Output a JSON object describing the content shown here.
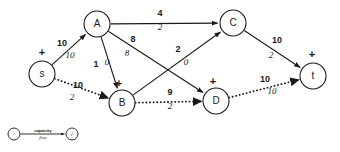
{
  "diagram": {
    "type": "network-flow-graph",
    "width": 340,
    "height": 152,
    "background_color": "#ffffff",
    "stroke_color": "#1a1a1a",
    "nodes": [
      {
        "id": "s",
        "label": "s",
        "x": 42,
        "y": 74,
        "r": 13,
        "marker": "+",
        "marker_x": 42,
        "marker_y": 53
      },
      {
        "id": "A",
        "label": "A",
        "x": 97,
        "y": 24,
        "r": 13,
        "marker": "",
        "marker_x": 0,
        "marker_y": 0
      },
      {
        "id": "B",
        "label": "B",
        "x": 122,
        "y": 103,
        "r": 13,
        "marker": "+",
        "marker_x": 119,
        "marker_y": 84
      },
      {
        "id": "C",
        "label": "C",
        "x": 233,
        "y": 23,
        "r": 13,
        "marker": "",
        "marker_x": 0,
        "marker_y": 0
      },
      {
        "id": "D",
        "label": "D",
        "x": 216,
        "y": 101,
        "r": 13,
        "marker": "+",
        "marker_x": 213,
        "marker_y": 82
      },
      {
        "id": "t",
        "label": "t",
        "x": 313,
        "y": 76,
        "r": 13,
        "marker": "+",
        "marker_x": 312,
        "marker_y": 55
      }
    ],
    "edges": [
      {
        "id": "s-A",
        "from": "s",
        "to": "A",
        "capacity": "10",
        "flow": "10",
        "style": "solid",
        "cap_x": 62,
        "cap_y": 44,
        "flow_x": 70,
        "flow_y": 56
      },
      {
        "id": "s-B",
        "from": "s",
        "to": "B",
        "capacity": "10",
        "flow": "2",
        "style": "dashed",
        "cap_x": 78,
        "cap_y": 86,
        "flow_x": 72,
        "flow_y": 98
      },
      {
        "id": "A-C",
        "from": "A",
        "to": "C",
        "capacity": "4",
        "flow": "2",
        "style": "solid",
        "cap_x": 160,
        "cap_y": 14,
        "flow_x": 160,
        "flow_y": 28
      },
      {
        "id": "A-B",
        "from": "A",
        "to": "B",
        "capacity": "1",
        "flow": "0",
        "style": "solid",
        "cap_x": 96,
        "cap_y": 65,
        "flow_x": 107,
        "flow_y": 63
      },
      {
        "id": "A-D",
        "from": "A",
        "to": "D",
        "capacity": "8",
        "flow": "8",
        "style": "solid",
        "cap_x": 133,
        "cap_y": 40,
        "flow_x": 127,
        "flow_y": 54
      },
      {
        "id": "B-C",
        "from": "B",
        "to": "C",
        "capacity": "2",
        "flow": "0",
        "style": "solid",
        "cap_x": 178,
        "cap_y": 50,
        "flow_x": 186,
        "flow_y": 63
      },
      {
        "id": "B-D",
        "from": "B",
        "to": "D",
        "capacity": "9",
        "flow": "2",
        "style": "dashed",
        "cap_x": 170,
        "cap_y": 93,
        "flow_x": 170,
        "flow_y": 107
      },
      {
        "id": "C-t",
        "from": "C",
        "to": "t",
        "capacity": "10",
        "flow": "2",
        "style": "solid",
        "cap_x": 277,
        "cap_y": 41,
        "flow_x": 271,
        "flow_y": 56
      },
      {
        "id": "D-t",
        "from": "D",
        "to": "t",
        "capacity": "10",
        "flow": "10",
        "style": "dashed",
        "cap_x": 265,
        "cap_y": 80,
        "flow_x": 272,
        "flow_y": 92
      }
    ],
    "legend": {
      "from_node_label": "i",
      "to_node_label": "j",
      "capacity_label": "capacity",
      "flow_label": "flow",
      "from_x": 14,
      "to_x": 72,
      "y": 134,
      "r": 6
    }
  }
}
